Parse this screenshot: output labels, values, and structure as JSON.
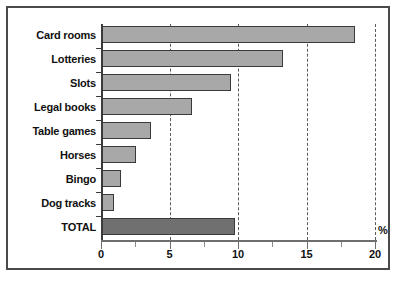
{
  "chart_data": {
    "type": "bar",
    "orientation": "horizontal",
    "title": "",
    "xlabel": "%",
    "ylabel": "",
    "xlim": [
      0,
      20
    ],
    "categories": [
      "Card rooms",
      "Lotteries",
      "Slots",
      "Legal books",
      "Table games",
      "Horses",
      "Bingo",
      "Dog tracks",
      "TOTAL"
    ],
    "values": [
      18.5,
      13.2,
      9.4,
      6.6,
      3.6,
      2.5,
      1.4,
      0.9,
      9.7
    ],
    "xticks": [
      0,
      5,
      10,
      15,
      20
    ],
    "xtick_labels": [
      "0",
      "5",
      "10",
      "15",
      "20"
    ],
    "minor_xticks": [
      2.5,
      7.5,
      12.5,
      17.5
    ],
    "gridlines": [
      5,
      10,
      15,
      20
    ],
    "grid": true,
    "legend": null,
    "colors": {
      "bar_fill": "#a8a8a8",
      "bar_edge": "#3a3a3a",
      "total_fill": "#707070",
      "axis": "#3c3c3c",
      "grid": "#5a5a5a",
      "frame": "#4a4a4a",
      "text": "#111111"
    },
    "highlight_category": "TOTAL"
  }
}
